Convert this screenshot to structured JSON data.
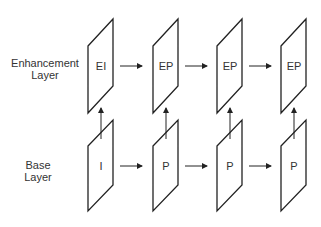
{
  "layers": [
    {
      "name": "Enhancement Layer",
      "line1": "Enhancement",
      "line2": "Layer",
      "frames": [
        "EI",
        "EP",
        "EP",
        "EP"
      ]
    },
    {
      "name": "Base Layer",
      "line1": "Base",
      "line2": "Layer",
      "frames": [
        "I",
        "P",
        "P",
        "P"
      ]
    }
  ],
  "colors": {
    "stroke": "#222222",
    "text": "#333333",
    "background": "#ffffff"
  }
}
